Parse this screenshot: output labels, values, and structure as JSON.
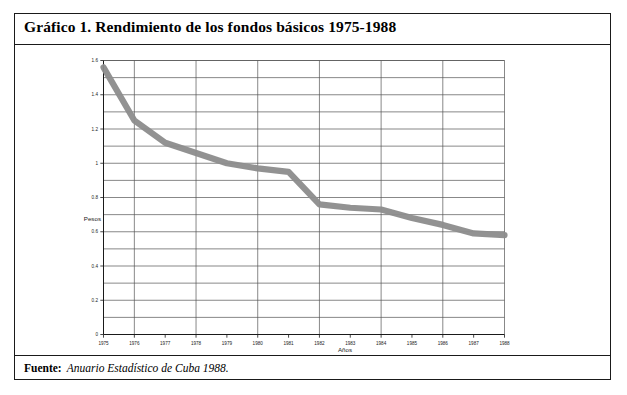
{
  "figure": {
    "title": "Gráfico 1.  Rendimiento de los fondos básicos 1975-1988",
    "source_label": "Fuente:",
    "source_text": "Anuario Estadístico de Cuba 1988."
  },
  "chart_data": {
    "type": "line",
    "title": "Rendimiento de los fondos básicos 1975-1988",
    "xlabel": "Años",
    "ylabel": "Pesos",
    "categories": [
      "1975",
      "1976",
      "1977",
      "1978",
      "1979",
      "1980",
      "1981",
      "1982",
      "1983",
      "1984",
      "1985",
      "1986",
      "1987",
      "1988"
    ],
    "x": [
      1975,
      1976,
      1977,
      1978,
      1979,
      1980,
      1981,
      1982,
      1983,
      1984,
      1985,
      1986,
      1987,
      1988
    ],
    "values": [
      1.56,
      1.25,
      1.12,
      1.06,
      1.0,
      0.97,
      0.95,
      0.76,
      0.74,
      0.73,
      0.68,
      0.64,
      0.59,
      0.58
    ],
    "series": [
      {
        "name": "Rendimiento de los fondos básicos",
        "values": [
          1.56,
          1.25,
          1.12,
          1.06,
          1.0,
          0.97,
          0.95,
          0.76,
          0.74,
          0.73,
          0.68,
          0.64,
          0.59,
          0.58
        ]
      }
    ],
    "ylim": [
      0,
      1.6
    ],
    "ytick_labels": [
      "0",
      "0.2",
      "0.4",
      "0.6",
      "0.8",
      "1",
      "1.2",
      "1.4",
      "1.6"
    ],
    "ytick_values": [
      0,
      0.2,
      0.4,
      0.6,
      0.8,
      1.0,
      1.2,
      1.4,
      1.6
    ],
    "y_gridline_step": 0.1,
    "x_gridline_years": [
      1976,
      1978,
      1980,
      1982,
      1984,
      1986,
      1988
    ],
    "grid": true,
    "legend": false,
    "line_color": "#8c8c8c",
    "grid_color": "#555555",
    "axis_color": "#1a1a1a"
  }
}
